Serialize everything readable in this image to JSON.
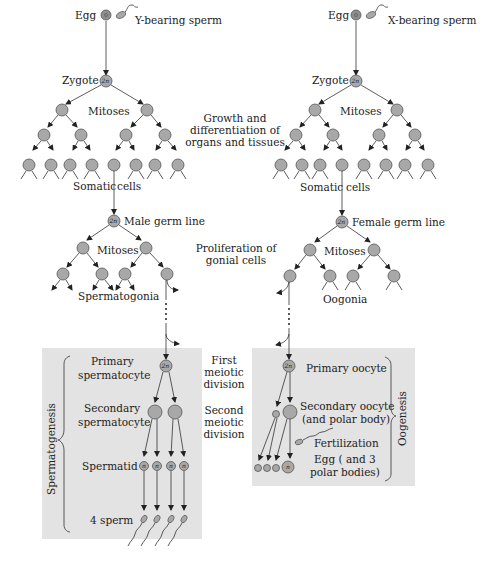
{
  "figure": {
    "male": {
      "egg_label": "Egg",
      "sperm_label": "Y-bearing sperm",
      "zygote_label": "Zygote",
      "zygote_ploidy": "2n",
      "mitoses_label": "Mitoses",
      "somatic_label": "Somatic",
      "cells_label": "cells",
      "germ_line_ploidy": "2n",
      "germ_line_label": "Male germ line",
      "mitoses2_label": "Mitoses",
      "gonia_label": "Spermatogonia",
      "panel": {
        "bracket_label": "Spermatogenesis",
        "primary_label_1": "Primary",
        "primary_label_2": "spermatocyte",
        "primary_ploidy": "2n",
        "secondary_label_1": "Secondary",
        "secondary_label_2": "spermatocyte",
        "spermatid_label": "Spermatid",
        "spermatid_ploidy": "n",
        "sperm_label": "4 sperm"
      }
    },
    "female": {
      "egg_label": "Egg",
      "sperm_label": "X-bearing sperm",
      "zygote_label": "Zygote",
      "zygote_ploidy": "2n",
      "mitoses_label": "Mitoses",
      "somatic_label": "Somatic",
      "cells_label": "cells",
      "germ_line_ploidy": "2n",
      "germ_line_label": "Female germ line",
      "mitoses2_label": "Mitoses",
      "gonia_label": "Oogonia",
      "panel": {
        "bracket_label": "Oogenesis",
        "primary_label": "Primary oocyte",
        "primary_ploidy": "2n",
        "secondary_label_1": "Secondary oocyte",
        "secondary_label_2": "(and polar body)",
        "fertilization_label": "Fertilization",
        "egg_label_1": "Egg ( and 3",
        "egg_label_2": "polar bodies)",
        "egg_ploidy": "n"
      }
    },
    "center_labels": {
      "growth_1": "Growth and",
      "growth_2": "differentiation of",
      "growth_3": "organs and tissues",
      "prolif_1": "Proliferation of",
      "prolif_2": "gonial cells",
      "first_1": "First",
      "first_2": "meiotic",
      "first_3": "division",
      "second_1": "Second",
      "second_2": "meiotic",
      "second_3": "division"
    },
    "colors": {
      "cell_fill": "#a8a8a8",
      "egg_fill": "#8e8e8e",
      "panel_fill": "#e3e3e3"
    }
  }
}
